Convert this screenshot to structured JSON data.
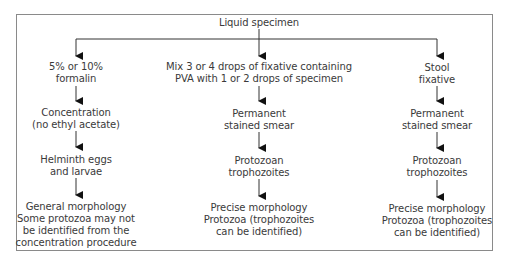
{
  "diagram": {
    "type": "flowchart",
    "root": {
      "id": "root",
      "lines": [
        "Liquid specimen"
      ]
    },
    "columns": [
      {
        "id": "formalin",
        "nodes": [
          {
            "lines": [
              "5% or 10%",
              "formalin"
            ]
          },
          {
            "lines": [
              "Concentration",
              "(no ethyl acetate)"
            ]
          },
          {
            "lines": [
              "Helminth eggs",
              "and larvae"
            ]
          },
          {
            "lines": [
              "General morphology",
              "Some protozoa may not",
              "be identified from the",
              "concentration procedure"
            ]
          }
        ]
      },
      {
        "id": "pva",
        "nodes": [
          {
            "lines": [
              "Mix 3 or 4 drops of fixative containing",
              "PVA with 1 or 2 drops of specimen"
            ]
          },
          {
            "lines": [
              "Permanent",
              "stained smear"
            ]
          },
          {
            "lines": [
              "Protozoan",
              "trophozoites"
            ]
          },
          {
            "lines": [
              "Precise morphology",
              "Protozoa (trophozoites",
              "can be identified)"
            ]
          }
        ]
      },
      {
        "id": "stool",
        "nodes": [
          {
            "lines": [
              "Stool",
              "fixative"
            ]
          },
          {
            "lines": [
              "Permanent",
              "stained smear"
            ]
          },
          {
            "lines": [
              "Protozoan",
              "trophozoites"
            ]
          },
          {
            "lines": [
              "Precise morphology",
              "Protozoa (trophozoites",
              "can be identified)"
            ]
          }
        ]
      }
    ],
    "colors": {
      "text": "#3a3a3a",
      "arrow": "#111111",
      "frame": "#8a8a8a"
    }
  }
}
